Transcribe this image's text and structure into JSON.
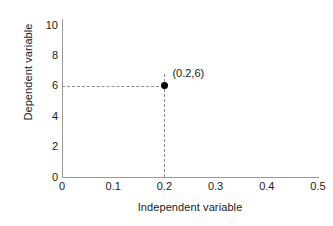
{
  "chart_data": {
    "type": "scatter",
    "title": "",
    "xlabel": "Independent variable",
    "ylabel": "Dependent variable",
    "xlim": [
      0,
      0.5
    ],
    "ylim": [
      0,
      10
    ],
    "grid": false,
    "legend": "none",
    "xticks": [
      "0",
      "0.1",
      "0.2",
      "0.3",
      "0.4",
      "0.5"
    ],
    "xtick_values": [
      0,
      0.1,
      0.2,
      0.3,
      0.4,
      0.5
    ],
    "yticks": [
      "0",
      "2",
      "4",
      "6",
      "8",
      "10"
    ],
    "ytick_values": [
      0,
      2,
      4,
      6,
      8,
      10
    ],
    "points": [
      {
        "x": 0.2,
        "y": 6,
        "label": "(0.2,6)",
        "marker": "filled-circle",
        "color": "#000000"
      }
    ],
    "annotations": [
      {
        "kind": "dashed-guide-horizontal",
        "from": [
          0,
          6
        ],
        "to": [
          0.2,
          6
        ]
      },
      {
        "kind": "dashed-guide-vertical",
        "from": [
          0.2,
          0
        ],
        "to": [
          0.2,
          6.75
        ]
      }
    ],
    "colors": {
      "axis": "#9a9a9a",
      "guide": "#8c8c8c",
      "marker": "#000000",
      "text": "#1a1a1a",
      "background": "#ffffff"
    }
  }
}
